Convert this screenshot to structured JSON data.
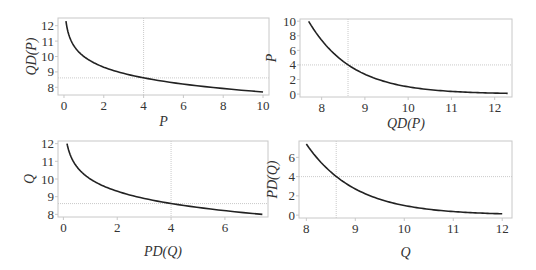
{
  "chart_data": [
    {
      "id": "top-left",
      "type": "line",
      "function": "QD(P) = 10 - ln(P)",
      "xlabel": "P",
      "ylabel": "QD(P)",
      "xlim": [
        -0.3,
        10.3
      ],
      "ylim": [
        7.5,
        12.5
      ],
      "xticks": [
        0,
        2,
        4,
        6,
        8,
        10
      ],
      "yticks": [
        8,
        9,
        10,
        11,
        12
      ],
      "x": [
        0.1,
        0.2,
        0.3,
        0.5,
        0.75,
        1,
        1.5,
        2,
        3,
        4,
        5,
        6,
        7,
        8,
        9,
        10
      ],
      "y": [
        12.3,
        11.61,
        11.2,
        10.69,
        10.29,
        10.0,
        9.59,
        9.31,
        8.9,
        8.61,
        8.39,
        8.21,
        8.05,
        7.92,
        7.8,
        7.7
      ],
      "reference": {
        "x": 4,
        "y": 8.61
      },
      "grid": false,
      "frame": {
        "left": 58,
        "top": 18,
        "right": 269,
        "bottom": 95
      }
    },
    {
      "id": "top-right",
      "type": "line",
      "function": "P = exp(10 - QD)",
      "xlabel": "QD(P)",
      "ylabel": "P",
      "xlim": [
        7.5,
        12.4
      ],
      "ylim": [
        -0.4,
        10.3
      ],
      "xticks": [
        8,
        9,
        10,
        11,
        12
      ],
      "yticks": [
        0,
        2,
        4,
        6,
        8,
        10
      ],
      "x": [
        7.7,
        7.9,
        8.1,
        8.3,
        8.5,
        8.61,
        8.8,
        9.0,
        9.3,
        9.6,
        10.0,
        10.4,
        10.8,
        11.2,
        11.6,
        12.0,
        12.3
      ],
      "y": [
        9.97,
        8.17,
        6.69,
        5.47,
        4.48,
        4.01,
        3.32,
        2.72,
        2.01,
        1.49,
        1.0,
        0.67,
        0.45,
        0.3,
        0.2,
        0.14,
        0.1
      ],
      "reference": {
        "x": 8.61,
        "y": 4
      },
      "grid": false,
      "frame": {
        "left": 300,
        "top": 19,
        "right": 512,
        "bottom": 97
      }
    },
    {
      "id": "bottom-left",
      "type": "line",
      "function": "Q = 10 - ln(PD(Q))",
      "xlabel": "PD(Q)",
      "ylabel": "Q",
      "xlim": [
        -0.2,
        7.6
      ],
      "ylim": [
        7.85,
        12.15
      ],
      "xticks": [
        0,
        2,
        4,
        6
      ],
      "yticks": [
        8,
        9,
        10,
        11,
        12
      ],
      "x": [
        0.135,
        0.2,
        0.3,
        0.5,
        0.75,
        1,
        1.5,
        2,
        3,
        4,
        5,
        6,
        7,
        7.39
      ],
      "y": [
        12.0,
        11.61,
        11.2,
        10.69,
        10.29,
        10.0,
        9.59,
        9.31,
        8.9,
        8.61,
        8.39,
        8.21,
        8.05,
        8.0
      ],
      "reference": {
        "x": 4,
        "y": 8.61
      },
      "grid": false,
      "frame": {
        "left": 58,
        "top": 141,
        "right": 268,
        "bottom": 217
      }
    },
    {
      "id": "bottom-right",
      "type": "line",
      "function": "PD(Q) = exp(10 - Q)",
      "xlabel": "Q",
      "ylabel": "PD(Q)",
      "xlim": [
        7.85,
        12.2
      ],
      "ylim": [
        -0.3,
        7.7
      ],
      "xticks": [
        8,
        9,
        10,
        11,
        12
      ],
      "yticks": [
        0,
        2,
        4,
        6
      ],
      "x": [
        8.0,
        8.2,
        8.4,
        8.61,
        8.8,
        9.0,
        9.3,
        9.6,
        10.0,
        10.4,
        10.8,
        11.2,
        11.6,
        12.0
      ],
      "y": [
        7.39,
        6.05,
        4.95,
        4.01,
        3.32,
        2.72,
        2.01,
        1.49,
        1.0,
        0.67,
        0.45,
        0.3,
        0.2,
        0.14
      ],
      "reference": {
        "x": 8.61,
        "y": 4
      },
      "grid": false,
      "frame": {
        "left": 299,
        "top": 141,
        "right": 512,
        "bottom": 218
      }
    }
  ]
}
